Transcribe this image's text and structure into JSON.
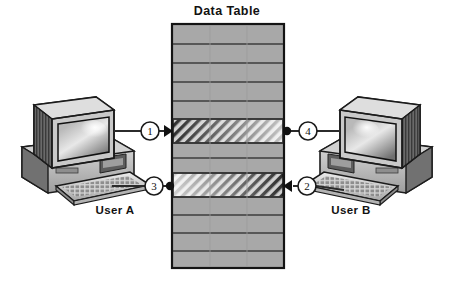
{
  "diagram": {
    "title": "Data Table",
    "type": "data-flow-illustration",
    "background_color": "#ffffff",
    "table": {
      "label": "Data Table",
      "fill_color": "#a8a8a8",
      "border_color": "#1a1a1a",
      "x": 172,
      "y": 24,
      "width": 112,
      "height": 244,
      "row_count": 11,
      "rows": [
        {
          "index": 1,
          "style": "plain"
        },
        {
          "index": 2,
          "style": "plain"
        },
        {
          "index": 3,
          "style": "plain"
        },
        {
          "index": 4,
          "style": "plain"
        },
        {
          "index": 5,
          "style": "plain"
        },
        {
          "index": 6,
          "style": "hatched",
          "gradient": "dark-to-light",
          "note": "row written by User A"
        },
        {
          "index": 7,
          "style": "plain"
        },
        {
          "index": 8,
          "style": "plain"
        },
        {
          "index": 9,
          "style": "hatched",
          "gradient": "light-to-dark",
          "note": "row written by User B"
        },
        {
          "index": 10,
          "style": "plain"
        },
        {
          "index": 11,
          "style": "plain"
        },
        {
          "index": 12,
          "style": "plain"
        },
        {
          "index": 13,
          "style": "plain"
        }
      ]
    },
    "actors": [
      {
        "id": "user-a",
        "label": "User A",
        "side": "left",
        "device": "desktop-computer"
      },
      {
        "id": "user-b",
        "label": "User B",
        "side": "right",
        "device": "desktop-computer"
      }
    ],
    "steps": [
      {
        "number": "1",
        "label": "1",
        "from": "user-a",
        "to": "data-table",
        "endpoint": "arrow",
        "direction": "right",
        "target_row": 6
      },
      {
        "number": "2",
        "label": "2",
        "from": "user-b",
        "to": "data-table",
        "endpoint": "arrow",
        "direction": "left",
        "target_row": 9
      },
      {
        "number": "3",
        "label": "3",
        "from": "user-a",
        "to": "data-table",
        "endpoint": "dot",
        "direction": "right",
        "target_row": 9
      },
      {
        "number": "4",
        "label": "4",
        "from": "user-b",
        "to": "data-table",
        "endpoint": "dot",
        "direction": "left",
        "target_row": 6
      }
    ],
    "colors": {
      "table_fill": "#a8a8a8",
      "line": "#2b2b2b",
      "text": "#121212",
      "computer_light": "#d8d8d8",
      "computer_mid": "#9a9a9a",
      "computer_dark": "#4d4d4d",
      "screen": "#8e8e8e"
    }
  }
}
